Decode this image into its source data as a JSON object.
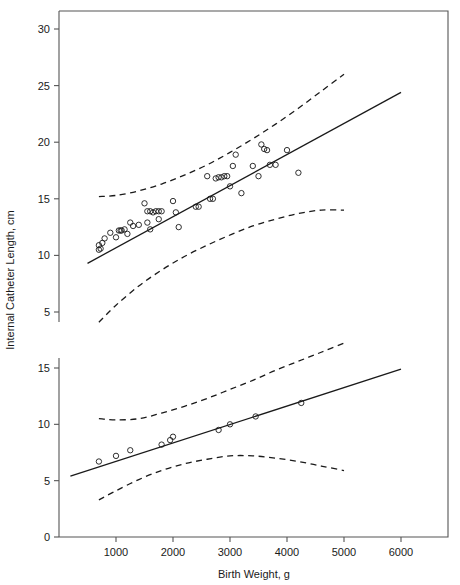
{
  "chart_data": {
    "type": "scatter",
    "title": "",
    "xlabel": "Birth Weight, g",
    "ylabel": "Internal Catheter Length, cm",
    "grid": false,
    "legend": "none",
    "broken_axis": true,
    "xlim": [
      0,
      6800
    ],
    "xticks": [
      1000,
      2000,
      3000,
      4000,
      5000,
      6000
    ],
    "xtick_labels": [
      "1000",
      "2000",
      "3000",
      "4000",
      "5000",
      "6000"
    ],
    "panels": [
      {
        "name": "upper-panel",
        "ylim": [
          3.5,
          31.5
        ],
        "yticks": [
          5,
          10,
          15,
          20,
          25,
          30
        ],
        "ytick_labels": [
          "5",
          "10",
          "15",
          "20",
          "25",
          "30"
        ],
        "regression_line": {
          "name": "upper-regression-line",
          "style": "solid",
          "x": [
            500,
            6000
          ],
          "y": [
            9.3,
            24.4
          ],
          "intercept": 7.93,
          "slope": 0.00275
        },
        "bands": [
          {
            "name": "upper-band-upper",
            "style": "dashed",
            "x": [
              700,
              1000,
              1400,
              1800,
              2200,
              2600,
              3000,
              3400,
              3800,
              4200,
              4600,
              5000
            ],
            "y": [
              15.2,
              15.3,
              15.7,
              16.3,
              17.1,
              18.0,
              19.1,
              20.3,
              21.6,
              23.0,
              24.5,
              26.0
            ]
          },
          {
            "name": "upper-band-lower",
            "style": "dashed",
            "x": [
              700,
              1000,
              1400,
              1800,
              2200,
              2600,
              3000,
              3400,
              3800,
              4200,
              4600,
              5000
            ],
            "y": [
              4.1,
              5.6,
              7.3,
              8.7,
              9.9,
              10.9,
              11.8,
              12.6,
              13.2,
              13.7,
              14.0,
              14.0
            ]
          }
        ],
        "points": [
          {
            "x": 700,
            "y": 10.5
          },
          {
            "x": 700,
            "y": 10.9
          },
          {
            "x": 730,
            "y": 10.6
          },
          {
            "x": 760,
            "y": 11.1
          },
          {
            "x": 800,
            "y": 11.5
          },
          {
            "x": 900,
            "y": 12.0
          },
          {
            "x": 1000,
            "y": 11.6
          },
          {
            "x": 1050,
            "y": 12.2
          },
          {
            "x": 1080,
            "y": 12.2
          },
          {
            "x": 1100,
            "y": 12.2
          },
          {
            "x": 1150,
            "y": 12.3
          },
          {
            "x": 1200,
            "y": 11.9
          },
          {
            "x": 1250,
            "y": 12.9
          },
          {
            "x": 1300,
            "y": 12.6
          },
          {
            "x": 1400,
            "y": 12.7
          },
          {
            "x": 1500,
            "y": 14.6
          },
          {
            "x": 1550,
            "y": 13.9
          },
          {
            "x": 1600,
            "y": 13.9
          },
          {
            "x": 1650,
            "y": 13.8
          },
          {
            "x": 1700,
            "y": 13.9
          },
          {
            "x": 1750,
            "y": 13.9
          },
          {
            "x": 1800,
            "y": 13.9
          },
          {
            "x": 1550,
            "y": 12.9
          },
          {
            "x": 1600,
            "y": 12.3
          },
          {
            "x": 1750,
            "y": 13.2
          },
          {
            "x": 2000,
            "y": 14.8
          },
          {
            "x": 2050,
            "y": 13.8
          },
          {
            "x": 2100,
            "y": 12.5
          },
          {
            "x": 2400,
            "y": 14.3
          },
          {
            "x": 2450,
            "y": 14.3
          },
          {
            "x": 2600,
            "y": 17.0
          },
          {
            "x": 2650,
            "y": 15.0
          },
          {
            "x": 2700,
            "y": 15.0
          },
          {
            "x": 2750,
            "y": 16.8
          },
          {
            "x": 2800,
            "y": 16.9
          },
          {
            "x": 2850,
            "y": 16.9
          },
          {
            "x": 2900,
            "y": 17.0
          },
          {
            "x": 2950,
            "y": 17.0
          },
          {
            "x": 3000,
            "y": 16.1
          },
          {
            "x": 3050,
            "y": 17.9
          },
          {
            "x": 3100,
            "y": 18.9
          },
          {
            "x": 3200,
            "y": 15.5
          },
          {
            "x": 3400,
            "y": 17.9
          },
          {
            "x": 3500,
            "y": 17.0
          },
          {
            "x": 3550,
            "y": 19.8
          },
          {
            "x": 3600,
            "y": 19.4
          },
          {
            "x": 3650,
            "y": 19.3
          },
          {
            "x": 3700,
            "y": 18.0
          },
          {
            "x": 3800,
            "y": 18.0
          },
          {
            "x": 4000,
            "y": 19.3
          },
          {
            "x": 4200,
            "y": 17.3
          }
        ]
      },
      {
        "name": "lower-panel",
        "ylim": [
          0,
          16.5
        ],
        "yticks": [
          0,
          5,
          10,
          15
        ],
        "ytick_labels": [
          "0",
          "5",
          "10",
          "15"
        ],
        "regression_line": {
          "name": "lower-regression-line",
          "style": "solid",
          "x": [
            200,
            6000
          ],
          "y": [
            5.4,
            14.9
          ],
          "intercept": 5.07,
          "slope": 0.00164
        },
        "bands": [
          {
            "name": "lower-band-upper",
            "style": "dashed",
            "x": [
              700,
              1000,
              1400,
              1800,
              2200,
              2600,
              3000,
              3400,
              3800,
              4200,
              4600,
              5000
            ],
            "y": [
              10.5,
              10.4,
              10.5,
              11.0,
              11.6,
              12.3,
              13.1,
              13.9,
              14.8,
              15.6,
              16.4,
              17.2
            ]
          },
          {
            "name": "lower-band-lower",
            "style": "dashed",
            "x": [
              700,
              1000,
              1400,
              1800,
              2200,
              2600,
              3000,
              3400,
              3800,
              4200,
              4600,
              5000
            ],
            "y": [
              3.3,
              4.1,
              5.1,
              5.9,
              6.5,
              6.9,
              7.2,
              7.2,
              7.0,
              6.7,
              6.3,
              5.9
            ]
          }
        ],
        "points": [
          {
            "x": 700,
            "y": 6.7
          },
          {
            "x": 1000,
            "y": 7.2
          },
          {
            "x": 1250,
            "y": 7.7
          },
          {
            "x": 1800,
            "y": 8.2
          },
          {
            "x": 1950,
            "y": 8.6
          },
          {
            "x": 2000,
            "y": 8.9
          },
          {
            "x": 2800,
            "y": 9.5
          },
          {
            "x": 3000,
            "y": 10.0
          },
          {
            "x": 3450,
            "y": 10.7
          },
          {
            "x": 4250,
            "y": 11.9
          }
        ]
      }
    ]
  },
  "axes": {
    "x_title": "Birth Weight, g",
    "y_title": "Internal Catheter Length, cm"
  },
  "style": {
    "line_color": "#1a1a1a",
    "marker_color": "#1a1a1a",
    "band_color": "#1a1a1a",
    "frame_color": "#555555",
    "background": "#ffffff"
  }
}
